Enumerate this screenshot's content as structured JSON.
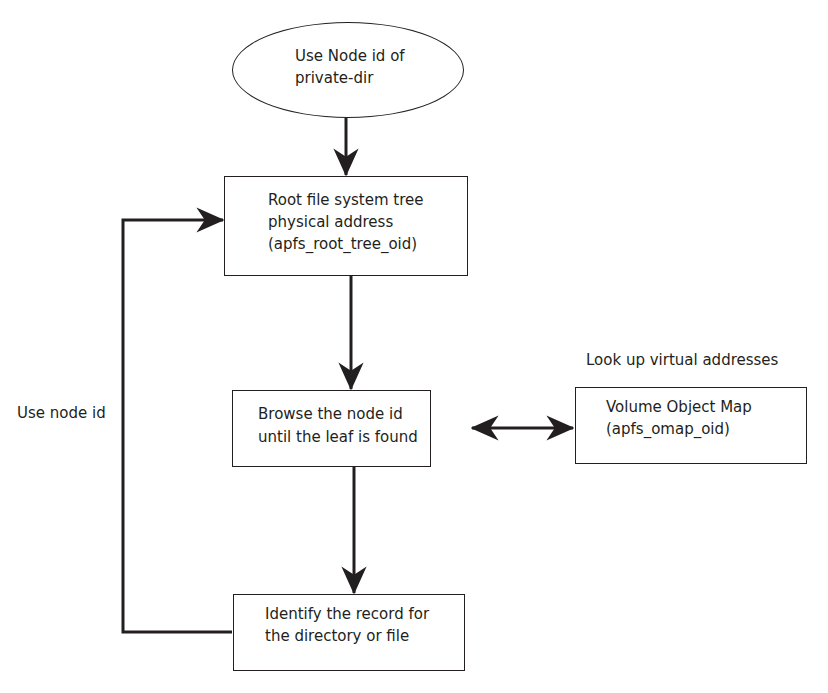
{
  "diagram": {
    "type": "flowchart",
    "start": {
      "id": "start",
      "shape": "ellipse",
      "lines": [
        "Use Node id of",
        "private-dir"
      ]
    },
    "nodes": [
      {
        "id": "root-tree",
        "shape": "rect",
        "lines": [
          "Root file system  tree",
          "physical address",
          "(apfs_root_tree_oid)"
        ]
      },
      {
        "id": "browse",
        "shape": "rect",
        "lines": [
          "Browse the node id",
          "until the leaf is found"
        ]
      },
      {
        "id": "omap",
        "shape": "rect",
        "lines": [
          "Volume Object Map",
          "(apfs_omap_oid)"
        ]
      },
      {
        "id": "identify",
        "shape": "rect",
        "lines": [
          "Identify the record for",
          "the directory or file"
        ]
      }
    ],
    "labels": {
      "lookup": "Look up virtual addresses",
      "loop": "Use node id"
    },
    "edges": [
      {
        "from": "start",
        "to": "root-tree",
        "type": "arrow"
      },
      {
        "from": "root-tree",
        "to": "browse",
        "type": "arrow"
      },
      {
        "from": "browse",
        "to": "omap",
        "type": "bidirectional",
        "label": "Look up virtual addresses"
      },
      {
        "from": "browse",
        "to": "identify",
        "type": "arrow"
      },
      {
        "from": "identify",
        "to": "root-tree",
        "type": "arrow",
        "label": "Use node id"
      }
    ],
    "colors": {
      "stroke": "#231f20",
      "background": "#ffffff",
      "text": "#231f20"
    }
  }
}
